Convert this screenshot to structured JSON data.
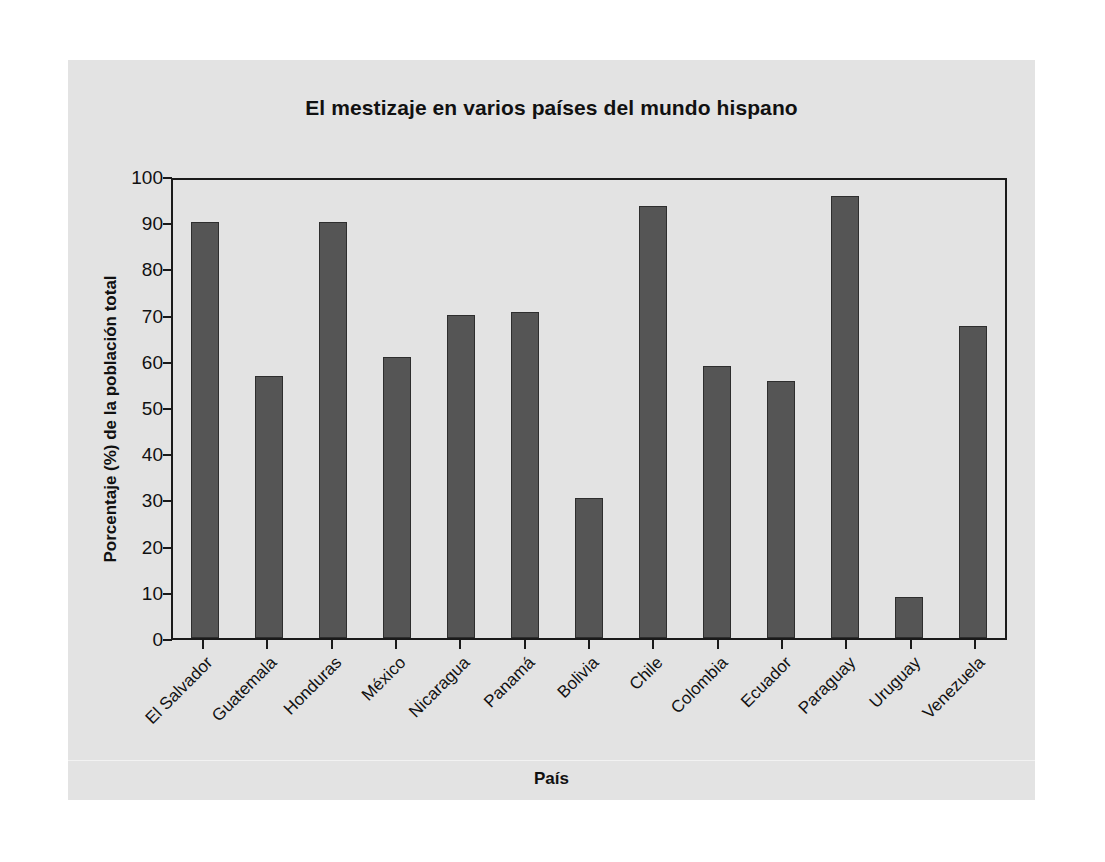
{
  "chart_data": {
    "type": "bar",
    "title": "El mestizaje en varios países del mundo hispano",
    "xlabel": "País",
    "ylabel": "Porcentaje (%) de la población total",
    "ylim": [
      0,
      100
    ],
    "ytick_labels": [
      "100",
      "90",
      "80",
      "70",
      "60",
      "50",
      "40",
      "30",
      "20",
      "10",
      "0"
    ],
    "yticks": [
      100,
      90,
      80,
      70,
      60,
      50,
      40,
      30,
      20,
      10,
      0
    ],
    "grid": false,
    "legend": "none",
    "bar_color": "#555555",
    "categories": [
      "El Salvador",
      "Guatemala",
      "Honduras",
      "México",
      "Nicaragua",
      "Panamá",
      "Bolivia",
      "Chile",
      "Colombia",
      "Ecuador",
      "Paraguay",
      "Uruguay",
      "Venezuela"
    ],
    "values": [
      90,
      56.7,
      90,
      60.8,
      69.9,
      70.6,
      30.3,
      93.5,
      58.9,
      55.6,
      95.7,
      8.9,
      67.5
    ]
  },
  "colors": {
    "panel_background": "#e3e3e3",
    "page_background": "#ffffff",
    "axis": "#1a1a1a",
    "bar": "#555555",
    "text": "#111111"
  }
}
